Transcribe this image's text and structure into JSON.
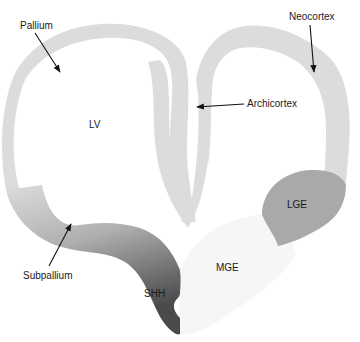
{
  "diagram": {
    "labels": {
      "pallium": "Pallium",
      "neocortex": "Neocortex",
      "archicortex": "Archicortex",
      "lv": "LV",
      "lge": "LGE",
      "mge": "MGE",
      "shh": "SHH",
      "subpallium": "Subpallium"
    },
    "colors": {
      "tissue": "#dcdcdc",
      "lge": "#a9a9a9",
      "shh_dark": "#4a4a4a",
      "mge": "#f7f7f7",
      "arrow": "#111111",
      "background": "#ffffff"
    }
  }
}
